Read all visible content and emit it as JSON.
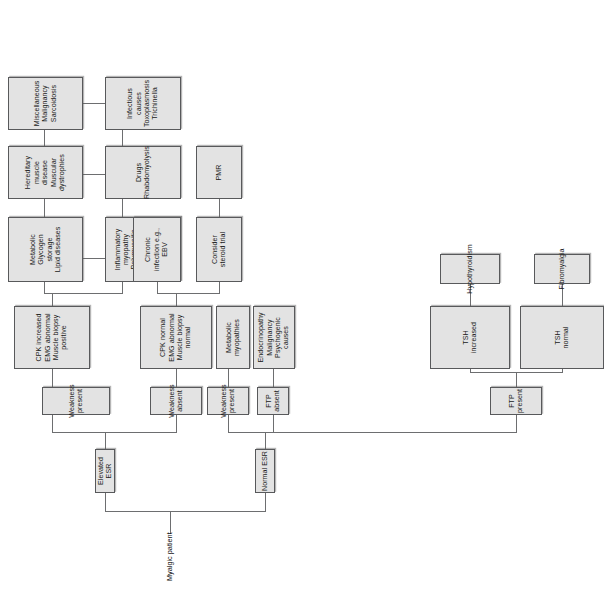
{
  "diagram": {
    "title": "Myalgic patient",
    "type": "clinical-decision-flowchart",
    "orientation": "rotated-90",
    "colors": {
      "node_fill": "#e3e3e3",
      "node_border": "#58595b",
      "connector": "#6d6e70",
      "page_background": "#ffffff",
      "text": "#1a1a1a"
    },
    "root": {
      "label": "Myalgic patient"
    },
    "level1": [
      {
        "label": "Elevated ESR"
      },
      {
        "label": "Normal ESR"
      }
    ],
    "level2": [
      {
        "label": "Weakness present"
      },
      {
        "label": "Weakness absent"
      },
      {
        "label": "Weakness present"
      },
      {
        "label": "FTP absent"
      },
      {
        "label": "FTP present"
      }
    ],
    "level3": [
      {
        "label": "CPK increased\nEMG abnormal\nMuscle biopsy\npositive"
      },
      {
        "label": "CPK normal\nEMG abnormal\nMuscle biopsy\nnormal"
      },
      {
        "label": "Metabolic\nmyopathies"
      },
      {
        "label": "Endocrinopathy\nMalignancy\nPsychogenic\ncauses"
      },
      {
        "label": "TSH\nincreased"
      },
      {
        "label": "TSH\nnormal"
      }
    ],
    "level4": [
      {
        "label": "Metabolic\nGlycogen\nstorage\nLipid diseases"
      },
      {
        "label": "Inflammatory\nmyopathy\nPolymyositis\nInclusion body\nmyositis\nEosinophilic\nmyositis"
      },
      {
        "label": "Chronic\ninfection e.g.,\nEBV"
      },
      {
        "label": "Consider\nsteroid trial"
      },
      {
        "label": "Hypothyroidism"
      },
      {
        "label": "Fibromyalgia"
      }
    ],
    "level5": [
      {
        "label": "Hereditary\nmuscle disease\nMuscular\ndystrophies"
      },
      {
        "label": "Drugs\nRhabdomyolysis"
      },
      {
        "label": "PMR"
      }
    ],
    "level6": [
      {
        "label": "Miscellaneous\nMalignancy\nSarcoidosis"
      },
      {
        "label": "Infectious\ncauses\nToxoplasmosis\nTrichinella"
      }
    ]
  }
}
